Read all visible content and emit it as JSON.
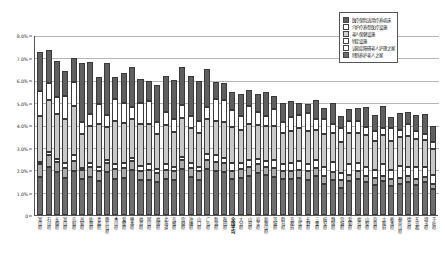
{
  "chart_data": {
    "type": "bar",
    "stacked": true,
    "title": "",
    "xlabel": "",
    "ylabel": "",
    "ylim": [
      0,
      0.08
    ],
    "ytick_labels": [
      "0",
      "1.0%",
      "2.0%",
      "3.0%",
      "4.0%",
      "5.0%",
      "6.0%",
      "7.0%",
      "8.0%"
    ],
    "ytick_values": [
      0,
      1.0,
      2.0,
      3.0,
      4.0,
      5.0,
      6.0,
      7.0,
      8.0
    ],
    "grid": true,
    "legend_position": "top-right",
    "categories": [
      "富山県",
      "石川県",
      "长崎県",
      "富山県",
      "鸟取県",
      "高知県",
      "佐贺県",
      "青森県",
      "鹿儿岛県",
      "香川県",
      "爱媛県",
      "熊本県",
      "福井県",
      "冈山県",
      "福冈県",
      "北海道",
      "岛根県",
      "宫崎県",
      "冲绳県",
      "山口県",
      "广岛県",
      "新潟県",
      "秋田県",
      "全国平均",
      "大分県",
      "山形県",
      "岩手県",
      "和歌山県",
      "茨城県",
      "群马県",
      "京都府",
      "兵库県",
      "长野県",
      "三重県",
      "岐阜県",
      "静冈県",
      "宫城県",
      "爱知県",
      "福岛県",
      "山梨県",
      "奈良県",
      "大阪府",
      "栃木県",
      "神奈川県",
      "德岛県",
      "东京都",
      "埼玉県",
      "千叶県"
    ],
    "series": [
      {
        "name": "医疗保险适用疗养病床",
        "color": "#5f5f5f",
        "values": [
          1.75,
          1.5,
          1.6,
          1.1,
          1.1,
          2.6,
          2.3,
          1.2,
          2.3,
          1.0,
          1.3,
          1.8,
          1.05,
          0.9,
          1.65,
          1.6,
          1.75,
          1.7,
          1.8,
          1.75,
          1.7,
          0.75,
          0.75,
          0.8,
          1.0,
          0.7,
          0.8,
          1.05,
          0.6,
          0.85,
          0.7,
          0.55,
          0.4,
          0.85,
          0.5,
          0.95,
          0.55,
          0.5,
          0.55,
          0.9,
          0.7,
          1.0,
          0.5,
          0.75,
          0.55,
          0.7,
          0.9,
          0.7
        ]
      },
      {
        "name": "介护疗养型医疗设施",
        "color": "#ffffff",
        "values": [
          1.1,
          0.75,
          0.75,
          1.05,
          1.05,
          0.55,
          0.55,
          0.9,
          0.55,
          0.95,
          0.9,
          0.55,
          0.95,
          1.0,
          0.55,
          0.6,
          0.55,
          0.6,
          0.55,
          0.55,
          0.55,
          0.95,
          0.95,
          0.75,
          0.6,
          0.8,
          0.6,
          0.45,
          0.75,
          0.5,
          0.6,
          0.6,
          0.8,
          0.45,
          0.65,
          0.4,
          0.6,
          0.55,
          0.55,
          0.35,
          0.45,
          0.3,
          0.55,
          0.35,
          0.55,
          0.35,
          0.25,
          0.3
        ]
      },
      {
        "name": "老人保健设施",
        "color": "#d2d2d2",
        "values": [
          2.05,
          2.3,
          2.0,
          1.95,
          2.2,
          1.5,
          1.65,
          1.9,
          1.45,
          1.95,
          1.8,
          1.7,
          1.85,
          1.8,
          1.55,
          1.75,
          1.55,
          1.7,
          1.55,
          1.5,
          1.55,
          1.55,
          1.6,
          1.6,
          1.5,
          1.6,
          1.5,
          1.55,
          1.5,
          1.4,
          1.45,
          1.45,
          1.5,
          1.35,
          1.45,
          1.3,
          1.4,
          1.4,
          1.35,
          1.4,
          1.3,
          1.3,
          1.3,
          1.25,
          1.35,
          1.25,
          1.2,
          1.15
        ]
      },
      {
        "name": "特定设施",
        "color": "#ffffff",
        "values": [
          0.1,
          0.15,
          0.15,
          0.2,
          0.25,
          0.1,
          0.15,
          0.2,
          0.15,
          0.2,
          0.2,
          0.15,
          0.25,
          0.25,
          0.2,
          0.25,
          0.2,
          0.15,
          0.2,
          0.2,
          0.25,
          0.3,
          0.25,
          0.35,
          0.25,
          0.3,
          0.25,
          0.25,
          0.35,
          0.3,
          0.35,
          0.4,
          0.3,
          0.35,
          0.4,
          0.45,
          0.3,
          0.45,
          0.35,
          0.4,
          0.35,
          0.5,
          0.4,
          0.55,
          0.4,
          0.55,
          0.45,
          0.4
        ]
      },
      {
        "name": "认知症障碍老人护理之家",
        "color": "#aaaaaa",
        "values": [
          0.55,
          0.5,
          0.45,
          0.45,
          0.45,
          0.4,
          0.45,
          0.45,
          0.4,
          0.45,
          0.45,
          0.4,
          0.4,
          0.45,
          0.4,
          0.4,
          0.4,
          0.4,
          0.4,
          0.4,
          0.4,
          0.4,
          0.4,
          0.35,
          0.4,
          0.4,
          0.4,
          0.35,
          0.4,
          0.35,
          0.35,
          0.35,
          0.4,
          0.35,
          0.35,
          0.35,
          0.35,
          0.3,
          0.35,
          0.3,
          0.3,
          0.25,
          0.3,
          0.25,
          0.3,
          0.25,
          0.25,
          0.25
        ]
      },
      {
        "name": "特别养护老人之家",
        "color": "#6e6e6e",
        "values": [
          1.7,
          2.15,
          1.9,
          1.65,
          1.95,
          1.6,
          1.7,
          1.5,
          1.9,
          1.6,
          1.65,
          2.0,
          1.55,
          1.55,
          1.45,
          1.6,
          1.55,
          2.05,
          1.7,
          1.55,
          2.05,
          1.95,
          1.9,
          1.6,
          1.65,
          1.75,
          1.85,
          1.8,
          1.7,
          1.6,
          1.6,
          1.65,
          1.55,
          1.75,
          1.4,
          1.55,
          1.2,
          1.5,
          1.6,
          1.45,
          1.35,
          1.5,
          1.3,
          1.4,
          1.45,
          1.35,
          1.45,
          1.15
        ]
      }
    ]
  },
  "legend": {
    "items": [
      {
        "label": "医疗保险适用疗养病床",
        "swatch": "sw0"
      },
      {
        "label": "介护疗养型医疗设施",
        "swatch": "sw1"
      },
      {
        "label": "老人保健设施",
        "swatch": "sw2"
      },
      {
        "label": "特定设施",
        "swatch": "sw3"
      },
      {
        "label": "认知症障碍老人护理之家",
        "swatch": "sw4"
      },
      {
        "label": "特别养护老人之家",
        "swatch": "sw5"
      }
    ]
  }
}
